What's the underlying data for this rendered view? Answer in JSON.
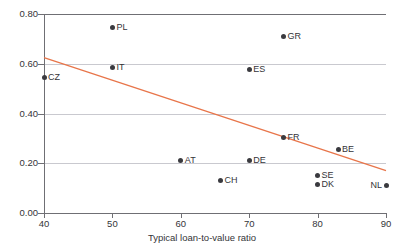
{
  "chart_data": {
    "type": "scatter",
    "title": "",
    "xlabel": "Typical loan-to-value ratio",
    "ylabel": "",
    "xlim": [
      40,
      90
    ],
    "ylim": [
      0.0,
      0.8
    ],
    "xticks": [
      40,
      50,
      60,
      70,
      80,
      90
    ],
    "xtick_labels": [
      "40",
      "50",
      "60",
      "70",
      "80",
      "90"
    ],
    "yticks": [
      0.0,
      0.2,
      0.4,
      0.6,
      0.8
    ],
    "ytick_labels": [
      "0.00",
      "0.20",
      "0.40",
      "0.60",
      "0.80"
    ],
    "grid": "horizontal",
    "legend": "none",
    "marker_color": "#3a3a3f",
    "trend_color": "#e8754a",
    "grid_color": "#c9c9cf",
    "axis_color": "#6f6f74",
    "points": [
      {
        "label": "CZ",
        "x": 40,
        "y": 0.545,
        "label_side": "right"
      },
      {
        "label": "PL",
        "x": 50,
        "y": 0.745,
        "label_side": "right"
      },
      {
        "label": "IT",
        "x": 50,
        "y": 0.585,
        "label_side": "right"
      },
      {
        "label": "ES",
        "x": 70,
        "y": 0.575,
        "label_side": "right"
      },
      {
        "label": "GR",
        "x": 75,
        "y": 0.71,
        "label_side": "right"
      },
      {
        "label": "AT",
        "x": 60,
        "y": 0.21,
        "label_side": "right"
      },
      {
        "label": "DE",
        "x": 70,
        "y": 0.21,
        "label_side": "right"
      },
      {
        "label": "CH",
        "x": 65.8,
        "y": 0.13,
        "label_side": "right"
      },
      {
        "label": "FR",
        "x": 75,
        "y": 0.305,
        "label_side": "right"
      },
      {
        "label": "BE",
        "x": 83,
        "y": 0.255,
        "label_side": "right"
      },
      {
        "label": "SE",
        "x": 80,
        "y": 0.15,
        "label_side": "right"
      },
      {
        "label": "DK",
        "x": 80,
        "y": 0.115,
        "label_side": "right"
      },
      {
        "label": "NL",
        "x": 90,
        "y": 0.11,
        "label_side": "left"
      }
    ],
    "trendline": {
      "x0": 40,
      "y0": 0.625,
      "x1": 90,
      "y1": 0.17
    }
  }
}
